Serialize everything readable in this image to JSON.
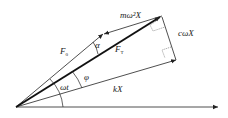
{
  "diagram": {
    "type": "phasor-vector-diagram",
    "labels": {
      "mass_force": "mω²X",
      "damping_force": "cωX",
      "total_force": "F",
      "total_force_sub": "T",
      "exciting_force": "F",
      "exciting_force_sub": "0",
      "spring_force": "kX",
      "angle_alpha": "α",
      "angle_phi": "φ",
      "angle_omega_t": "ωt"
    },
    "vectors": [
      {
        "name": "F_T",
        "from": [
          16,
          107
        ],
        "to": [
          162,
          16
        ],
        "weight": "thick"
      },
      {
        "name": "F_0",
        "from": [
          16,
          107
        ],
        "to": [
          103,
          34
        ],
        "weight": "thin"
      },
      {
        "name": "mω²X",
        "from": [
          162,
          16
        ],
        "to": [
          103,
          34
        ],
        "weight": "thin"
      },
      {
        "name": "kX",
        "from": [
          16,
          107
        ],
        "to": [
          176,
          60
        ],
        "weight": "thin"
      },
      {
        "name": "cωX",
        "from": [
          176,
          60
        ],
        "to": [
          162,
          16
        ],
        "weight": "thin"
      },
      {
        "name": "reference-axis",
        "from": [
          16,
          107
        ],
        "to": [
          218,
          107
        ],
        "weight": "thin"
      }
    ],
    "colors": {
      "line": "#222222",
      "background": "#ffffff"
    }
  }
}
